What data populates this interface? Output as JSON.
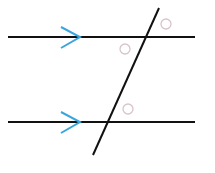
{
  "diagram": {
    "type": "parallel-lines-transversal",
    "colors": {
      "line": "#111111",
      "arrow": "#3aa6dd",
      "angle_marker": "#d8c4c8",
      "background": "#ffffff"
    },
    "parallel_lines": [
      {
        "name": "top-line",
        "x1": 8,
        "y1": 37,
        "x2": 195,
        "y2": 37,
        "arrow_tip_x": 80
      },
      {
        "name": "bottom-line",
        "x1": 8,
        "y1": 122,
        "x2": 195,
        "y2": 122,
        "arrow_tip_x": 80
      }
    ],
    "transversal": {
      "x1": 159,
      "y1": 8,
      "x2": 93,
      "y2": 155
    },
    "angle_markers": [
      {
        "name": "angle-top-right",
        "cx": 166,
        "cy": 24,
        "r": 5
      },
      {
        "name": "angle-top-inner-left",
        "cx": 125,
        "cy": 49,
        "r": 5
      },
      {
        "name": "angle-bottom-upper-right",
        "cx": 128,
        "cy": 109,
        "r": 5
      }
    ]
  }
}
